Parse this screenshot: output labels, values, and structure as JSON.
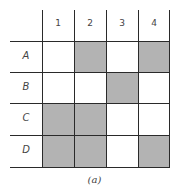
{
  "figure": {
    "caption": "(a)",
    "columns": [
      "1",
      "2",
      "3",
      "4"
    ],
    "rows": [
      {
        "label": "A",
        "cells": [
          false,
          true,
          false,
          true
        ]
      },
      {
        "label": "B",
        "cells": [
          false,
          false,
          true,
          false
        ]
      },
      {
        "label": "C",
        "cells": [
          true,
          true,
          false,
          false
        ]
      },
      {
        "label": "D",
        "cells": [
          true,
          true,
          false,
          true
        ]
      }
    ],
    "shade_color": "#b3b3b3",
    "line_color": "#2a2a2a"
  }
}
